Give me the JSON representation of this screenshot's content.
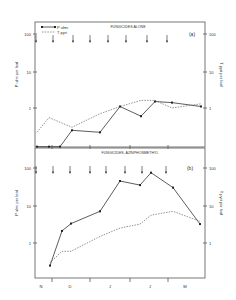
{
  "chart_data": [
    {
      "type": "line",
      "panel": "(a)",
      "title": "FUNGICIDES ALONE",
      "ylabel_left": "P ulmi per leaf",
      "ylabel_right": "T pyri per leaf",
      "yscale": "log",
      "ylim": [
        0.08,
        200
      ],
      "yticks": [
        "100",
        "10",
        "1"
      ],
      "xlabel": "",
      "x_tick_labels": [
        "N",
        "D",
        "J",
        "J",
        "M"
      ],
      "legend": [
        {
          "name": "P ulmi",
          "style": "solid with markers"
        },
        {
          "name": "T pyri",
          "style": "dashed"
        }
      ],
      "spray_arrows_x": [
        36,
        53,
        73,
        90,
        108,
        126,
        147,
        167
      ],
      "series": [
        {
          "name": "P ulmi",
          "x": [
            37,
            49,
            60,
            72,
            100,
            120,
            141,
            155,
            172,
            201
          ],
          "values": [
            0.09,
            0.09,
            0.09,
            0.25,
            0.22,
            1.1,
            0.6,
            1.5,
            1.4,
            1.1
          ]
        },
        {
          "name": "T pyri",
          "x": [
            37,
            49,
            72,
            100,
            120,
            141,
            155,
            172,
            201
          ],
          "values": [
            0.22,
            0.55,
            0.3,
            0.7,
            1.1,
            1.6,
            1.6,
            1.0,
            1.3
          ]
        }
      ]
    },
    {
      "type": "line",
      "panel": "(b)",
      "title": "FUNGICIDES, AZINPHOSMETHYL",
      "ylabel_left": "P ulmi per leaf",
      "ylabel_right": "T pyri per leaf",
      "yscale": "log",
      "ylim": [
        0.06,
        200
      ],
      "yticks": [
        "100",
        "10",
        "1"
      ],
      "x_tick_labels": [
        "N",
        "D",
        "J",
        "J",
        "M"
      ],
      "spray_arrows_x": [
        36,
        53,
        70,
        90,
        106,
        125,
        142,
        166
      ],
      "series": [
        {
          "name": "P ulmi",
          "x": [
            50,
            62,
            71,
            100,
            120,
            140,
            151,
            173,
            200
          ],
          "values": [
            0.25,
            2.1,
            3.3,
            7,
            45,
            35,
            75,
            30,
            3.2
          ]
        },
        {
          "name": "T pyri",
          "x": [
            50,
            62,
            71,
            100,
            120,
            140,
            151,
            173,
            200
          ],
          "values": [
            0.3,
            0.6,
            0.6,
            1.5,
            2.5,
            3.2,
            5.5,
            7,
            3.8
          ]
        }
      ]
    }
  ]
}
